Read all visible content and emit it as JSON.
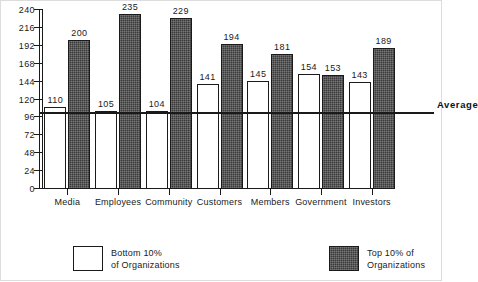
{
  "chart_data": {
    "type": "bar",
    "title": "",
    "subtitle": "",
    "xlabel": "",
    "ylabel": "",
    "categories": [
      "Media",
      "Employees",
      "Community",
      "Customers",
      "Members",
      "Government",
      "Investors"
    ],
    "series": [
      {
        "name": "Bottom 10% of Organizations",
        "color": "#ffffff",
        "values": [
          110,
          105,
          104,
          141,
          145,
          154,
          143
        ]
      },
      {
        "name": "Top 10% of Organizations",
        "color": "#3a3a3a",
        "values": [
          200,
          235,
          229,
          194,
          181,
          153,
          189
        ]
      }
    ],
    "ylim": [
      0,
      240
    ],
    "yticks": [
      0,
      24,
      48,
      72,
      96,
      120,
      144,
      168,
      192,
      216,
      240
    ],
    "ytick_labels": [
      "0",
      "24",
      "48",
      "72",
      "96",
      "120",
      "144",
      "168",
      "192",
      "216",
      "240"
    ],
    "grid": false,
    "legend_position": "bottom",
    "annotations": [
      {
        "name": "average-line",
        "label": "Average",
        "value": 100,
        "orientation": "horizontal"
      }
    ]
  },
  "legend": {
    "items": [
      {
        "label_line1": "Bottom  10%",
        "label_line2": "of  Organizations",
        "swatch": "light"
      },
      {
        "label_line1": "Top 10% of",
        "label_line2": "Organizations",
        "swatch": "dark"
      }
    ]
  }
}
